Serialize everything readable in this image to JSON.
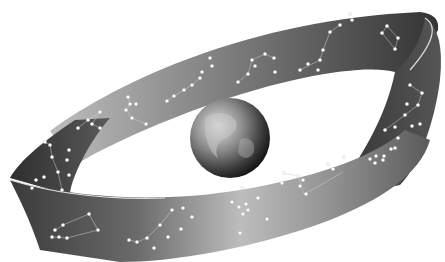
{
  "illustration": {
    "subject": "Zodiac band of constellations encircling Earth",
    "background_color": "#ffffff",
    "band_dark_color": "#3a3a3a",
    "band_light_color": "#b8b8b8",
    "star_color": "#ffffff",
    "globe_dark_color": "#1e1e1e",
    "globe_light_color": "#d0d0d0"
  }
}
